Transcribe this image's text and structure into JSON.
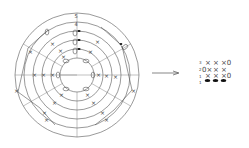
{
  "diagram": {
    "ring_labels": [
      "5",
      "4",
      "3",
      "2",
      "1"
    ],
    "visible_ring_labels": [
      {
        "ring": 5,
        "label": "5"
      },
      {
        "ring": 4,
        "label": "4"
      }
    ],
    "symbols": {
      "cross": "×",
      "open": "0",
      "filled": "●"
    },
    "arrow": "→",
    "grid": {
      "rows": [
        {
          "label": "3",
          "cells": [
            "×",
            "×",
            "×0"
          ]
        },
        {
          "label": "2",
          "cells": [
            "0×",
            "×",
            "×"
          ]
        },
        {
          "label": "1",
          "cells": [
            "×",
            "×",
            "×0"
          ]
        },
        {
          "label": "1",
          "cells": [
            "●",
            "●",
            "●"
          ]
        }
      ]
    },
    "colors": {
      "line": "#555555",
      "mark": "#444444",
      "filled": "#111111",
      "background": "#ffffff"
    }
  }
}
